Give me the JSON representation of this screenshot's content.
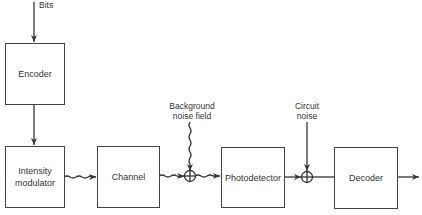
{
  "diagram": {
    "type": "block-diagram",
    "input_label": "Bits",
    "blocks": [
      {
        "id": "encoder",
        "label": "Encoder"
      },
      {
        "id": "modulator",
        "label": "Intensity\nmodulator"
      },
      {
        "id": "channel",
        "label": "Channel"
      },
      {
        "id": "photodetector",
        "label": "Photodetector"
      },
      {
        "id": "decoder",
        "label": "Decoder"
      }
    ],
    "noise_inputs": [
      {
        "id": "background-noise",
        "label": "Background\nnoise field",
        "signal": "optical"
      },
      {
        "id": "circuit-noise",
        "label": "Circuit\nnoise",
        "signal": "electrical"
      }
    ],
    "summing_symbol": "⊕",
    "connections": [
      {
        "from": "Bits",
        "to": "encoder",
        "signal": "electrical"
      },
      {
        "from": "encoder",
        "to": "modulator",
        "signal": "electrical"
      },
      {
        "from": "modulator",
        "to": "channel",
        "signal": "optical"
      },
      {
        "from": "channel",
        "to": "sum1",
        "signal": "optical"
      },
      {
        "from": "background-noise",
        "to": "sum1",
        "signal": "optical"
      },
      {
        "from": "sum1",
        "to": "photodetector",
        "signal": "optical"
      },
      {
        "from": "photodetector",
        "to": "sum2",
        "signal": "electrical"
      },
      {
        "from": "circuit-noise",
        "to": "sum2",
        "signal": "electrical"
      },
      {
        "from": "sum2",
        "to": "decoder",
        "signal": "electrical"
      },
      {
        "from": "decoder",
        "to": "output",
        "signal": "electrical"
      }
    ]
  }
}
